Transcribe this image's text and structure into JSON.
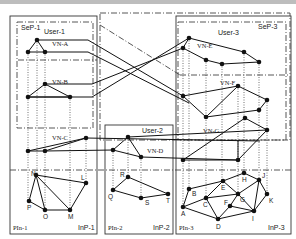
{
  "colors": {
    "line": "#111111",
    "box": "#333333",
    "background": "#ffffff",
    "topbar": "#bdbdbd"
  },
  "service_providers": [
    {
      "id": "SeP-1",
      "label": "SeP-1",
      "x": 20,
      "y": 18,
      "w": 74,
      "h": 110
    },
    {
      "id": "SeP-2",
      "label": "",
      "x": 100,
      "y": 14,
      "w": 190,
      "h": 126
    },
    {
      "id": "SeP-3",
      "label": "SeP-3",
      "x": 176,
      "y": 18,
      "w": 110,
      "h": 122
    }
  ],
  "infrastructure_providers": [
    {
      "id": "InP-1",
      "pin_label": "PIn-1",
      "inp_label": "InP-1",
      "x": 10,
      "y": 16,
      "w": 87,
      "h": 218
    },
    {
      "id": "InP-2",
      "pin_label": "PIn-2",
      "inp_label": "InP-2",
      "x": 105,
      "y": 125,
      "w": 68,
      "h": 109
    },
    {
      "id": "InP-3",
      "pin_label": "PIn-3",
      "inp_label": "InP-3",
      "x": 176,
      "y": 16,
      "w": 115,
      "h": 218
    }
  ],
  "users": [
    {
      "label": "User-1",
      "x": 44,
      "y": 33
    },
    {
      "label": "User-2",
      "x": 142,
      "y": 132
    },
    {
      "label": "User-3",
      "x": 218,
      "y": 34
    }
  ],
  "virtual_networks": [
    {
      "label": "VN-A",
      "x": 52,
      "y": 44
    },
    {
      "label": "VN-B",
      "x": 52,
      "y": 82
    },
    {
      "label": "VN-C",
      "x": 52,
      "y": 138
    },
    {
      "label": "VN-D",
      "x": 147,
      "y": 151
    },
    {
      "label": "VN-E",
      "x": 198,
      "y": 46
    },
    {
      "label": "VN-F",
      "x": 220,
      "y": 83
    },
    {
      "label": "VN-G",
      "x": 205,
      "y": 131
    }
  ],
  "physical_nodes": [
    {
      "label": "N",
      "x": 36,
      "y": 175
    },
    {
      "label": "L",
      "x": 86,
      "y": 183
    },
    {
      "label": "P",
      "x": 29,
      "y": 201
    },
    {
      "label": "O",
      "x": 45,
      "y": 210
    },
    {
      "label": "M",
      "x": 70,
      "y": 210
    },
    {
      "label": "R",
      "x": 128,
      "y": 177
    },
    {
      "label": "Q",
      "x": 113,
      "y": 190
    },
    {
      "label": "S",
      "x": 141,
      "y": 198
    },
    {
      "label": "T",
      "x": 168,
      "y": 194
    },
    {
      "label": "A",
      "x": 183,
      "y": 207
    },
    {
      "label": "B",
      "x": 189,
      "y": 189
    },
    {
      "label": "C",
      "x": 206,
      "y": 198
    },
    {
      "label": "E",
      "x": 223,
      "y": 181
    },
    {
      "label": "F",
      "x": 230,
      "y": 206
    },
    {
      "label": "G",
      "x": 238,
      "y": 194
    },
    {
      "label": "H",
      "x": 244,
      "y": 173
    },
    {
      "label": "J",
      "x": 259,
      "y": 180
    },
    {
      "label": "K",
      "x": 267,
      "y": 194
    },
    {
      "label": "D",
      "x": 218,
      "y": 219
    },
    {
      "label": "I",
      "x": 254,
      "y": 211
    }
  ]
}
